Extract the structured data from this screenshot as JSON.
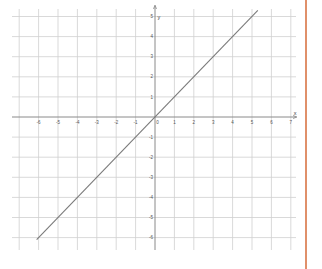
{
  "chart_data": {
    "type": "line",
    "title": "",
    "xlabel": "x",
    "ylabel": "y",
    "xlim": [
      -7,
      7
    ],
    "ylim": [
      -6,
      5
    ],
    "grid": true,
    "x_ticks": [
      -6,
      -5,
      -4,
      -3,
      -2,
      -1,
      0,
      1,
      2,
      3,
      4,
      5,
      6,
      7
    ],
    "y_ticks": [
      -6,
      -5,
      -4,
      -3,
      -2,
      -1,
      1,
      2,
      3,
      4,
      5
    ],
    "series": [
      {
        "name": "y = x",
        "equation": "y = x",
        "x": [
          -6.1,
          5.3
        ],
        "y": [
          -6.1,
          5.3
        ],
        "color": "#808080"
      }
    ],
    "legend": null
  },
  "colors": {
    "grid": "#cfcfcf",
    "axis": "#8a8a8a",
    "line": "#7a7a7a",
    "border": "#e0906a",
    "background": "#ffffff"
  },
  "labels": {
    "x_axis_name": "x",
    "y_axis_name": "y",
    "origin_label": "0"
  }
}
